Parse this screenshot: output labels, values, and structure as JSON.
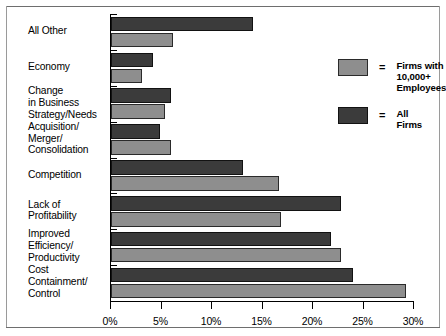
{
  "chart_data": {
    "type": "bar",
    "orientation": "horizontal",
    "title": "",
    "xlabel": "",
    "ylabel": "",
    "xlim": [
      0,
      30
    ],
    "xticks": [
      0,
      5,
      10,
      15,
      20,
      25,
      30
    ],
    "xtick_labels": [
      "0%",
      "5%",
      "10%",
      "15%",
      "20%",
      "25%",
      "30%"
    ],
    "grid": false,
    "legend_position": "inside-upper-right",
    "categories": [
      "All Other",
      "Economy",
      "Change\nin Business\nStrategy/Needs",
      "Acquisition/\nMerger/\nConsolidation",
      "Competition",
      "Lack of\nProfitability",
      "Improved\nEfficiency/\nProductivity",
      "Cost\nContainment/\nControl"
    ],
    "series": [
      {
        "name": "All Firms",
        "color": "#3b3b3b",
        "values": [
          14.1,
          4.2,
          5.9,
          4.9,
          13.1,
          22.8,
          21.8,
          24.0
        ]
      },
      {
        "name": "Firms with 10,000+\nEmployees",
        "color": "#8e8e8e",
        "values": [
          6.1,
          3.1,
          5.3,
          5.9,
          16.6,
          16.8,
          22.8,
          29.2
        ]
      }
    ]
  },
  "legend": {
    "equals_symbol": "=",
    "entries": [
      {
        "swatch": "light",
        "label": "Firms with 10,000+\nEmployees"
      },
      {
        "swatch": "dark",
        "label": "All Firms"
      }
    ]
  }
}
